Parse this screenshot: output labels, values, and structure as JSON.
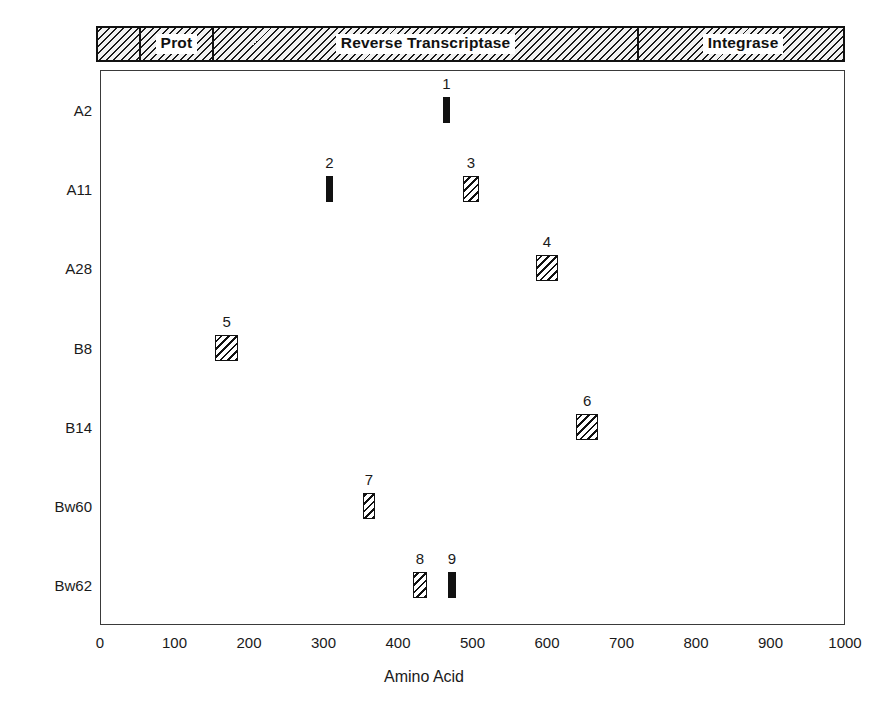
{
  "figure": {
    "x_axis_title": "Amino Acid",
    "x_ticks": [
      "0",
      "100",
      "200",
      "300",
      "400",
      "500",
      "600",
      "700",
      "800",
      "900",
      "1000"
    ],
    "axis_min": 0,
    "axis_max": 1000,
    "colors": {
      "ink": "#111111",
      "frame": "#3a3a3a",
      "background": "#ffffff"
    }
  },
  "domain_bar": {
    "segments": [
      {
        "label": "",
        "start": 0,
        "end": 55
      },
      {
        "label": "Prot",
        "start": 55,
        "end": 152
      },
      {
        "label": "Reverse Transcriptase",
        "start": 152,
        "end": 720
      },
      {
        "label": "Integrase",
        "start": 720,
        "end": 1000
      }
    ]
  },
  "rows": [
    {
      "label": "A2"
    },
    {
      "label": "A11"
    },
    {
      "label": "A28"
    },
    {
      "label": "B8"
    },
    {
      "label": "B14"
    },
    {
      "label": "Bw60"
    },
    {
      "label": "Bw62"
    }
  ],
  "chart_data": {
    "type": "scatter",
    "title": "",
    "xlabel": "Amino Acid",
    "ylabel": "",
    "xlim": [
      0,
      1000
    ],
    "grid": false,
    "legend": "none",
    "categories": [
      "A2",
      "A11",
      "A28",
      "B8",
      "B14",
      "Bw60",
      "Bw62"
    ],
    "markers": [
      {
        "number": "1",
        "row": "A2",
        "row_index": 0,
        "start": 460,
        "end": 470,
        "fill": "solid"
      },
      {
        "number": "2",
        "row": "A11",
        "row_index": 1,
        "start": 303,
        "end": 313,
        "fill": "solid"
      },
      {
        "number": "3",
        "row": "A11",
        "row_index": 1,
        "start": 487,
        "end": 509,
        "fill": "hatched"
      },
      {
        "number": "4",
        "row": "A28",
        "row_index": 2,
        "start": 585,
        "end": 615,
        "fill": "hatched"
      },
      {
        "number": "5",
        "row": "B8",
        "row_index": 3,
        "start": 155,
        "end": 185,
        "fill": "hatched"
      },
      {
        "number": "6",
        "row": "B14",
        "row_index": 4,
        "start": 639,
        "end": 669,
        "fill": "hatched"
      },
      {
        "number": "7",
        "row": "Bw60",
        "row_index": 5,
        "start": 353,
        "end": 369,
        "fill": "hatched"
      },
      {
        "number": "8",
        "row": "Bw62",
        "row_index": 6,
        "start": 420,
        "end": 439,
        "fill": "hatched"
      },
      {
        "number": "9",
        "row": "Bw62",
        "row_index": 6,
        "start": 467,
        "end": 478,
        "fill": "solid"
      }
    ]
  }
}
